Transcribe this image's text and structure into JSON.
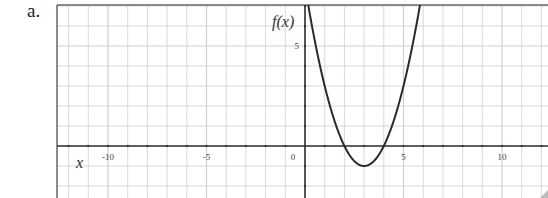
{
  "problem_label": "a.",
  "chart_data": {
    "type": "line",
    "title": "",
    "xlabel": "x",
    "ylabel": "f(x)",
    "xlim": [
      -12.5,
      12.4
    ],
    "ylim": [
      -2.6,
      7.1
    ],
    "grid": true,
    "x_ticks": [
      -10,
      -5,
      0,
      5,
      10
    ],
    "y_ticks": [
      5
    ],
    "x_tick_labels": [
      "-10",
      "-5",
      "0",
      "5",
      "10"
    ],
    "y_tick_labels": [
      "5"
    ],
    "series": [
      {
        "name": "f(x)",
        "function": "(x-2)(x-4)",
        "vertex": [
          3,
          -1
        ],
        "roots": [
          2,
          4
        ],
        "points": [
          [
            0.1,
            7.4
          ],
          [
            1,
            3
          ],
          [
            2,
            0
          ],
          [
            3,
            -1
          ],
          [
            4,
            0
          ],
          [
            5,
            3
          ],
          [
            5.9,
            7.2
          ]
        ]
      }
    ]
  },
  "colors": {
    "grid": "#cfcfcf",
    "axis": "#333333",
    "curve": "#2a2a2a",
    "border": "#666666"
  }
}
